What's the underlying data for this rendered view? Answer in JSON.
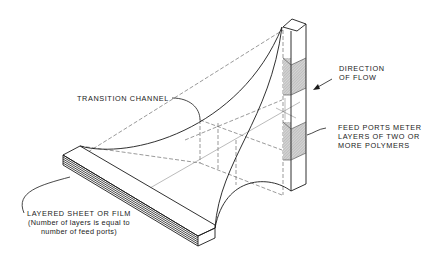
{
  "labels": {
    "transition_channel": "TRANSITION CHANNEL",
    "direction_of_flow": [
      "DIRECTION",
      "OF FLOW"
    ],
    "feed_ports": [
      "FEED PORTS METER",
      "LAYERS OF TWO OR",
      "MORE POLYMERS"
    ],
    "layered_sheet": {
      "title": "LAYERED SHEET OR FILM",
      "note": [
        "(Number of layers is equal to",
        "number of feed ports)"
      ]
    }
  },
  "colors": {
    "line": "#1a1a1a",
    "hatch": "#b8b8b8",
    "background": "#ffffff"
  },
  "components": [
    "feed-port-block",
    "transition-channel",
    "layered-sheet",
    "flow-arrow"
  ]
}
